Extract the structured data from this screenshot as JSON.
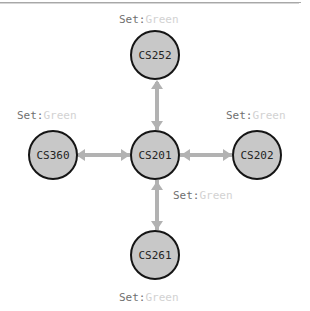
{
  "graph": {
    "type": "node-link-diagram",
    "layout": "cross",
    "nodes": [
      {
        "id": "center",
        "label": "CS201",
        "position": "center"
      },
      {
        "id": "top",
        "label": "CS252",
        "position": "top"
      },
      {
        "id": "left",
        "label": "CS360",
        "position": "left"
      },
      {
        "id": "right",
        "label": "CS202",
        "position": "right"
      },
      {
        "id": "bottom",
        "label": "CS261",
        "position": "bottom"
      }
    ],
    "edges": [
      {
        "from": "CS201",
        "to": "CS252",
        "direction": "bidirectional",
        "annotation_key": "Set:",
        "annotation_value": "Green"
      },
      {
        "from": "CS201",
        "to": "CS360",
        "direction": "bidirectional",
        "annotation_key": "Set:",
        "annotation_value": "Green"
      },
      {
        "from": "CS201",
        "to": "CS202",
        "direction": "bidirectional",
        "annotation_key": "Set:",
        "annotation_value": "Green"
      },
      {
        "from": "CS201",
        "to": "CS261",
        "direction": "bidirectional",
        "annotation_key": "Set:",
        "annotation_value": "Green"
      }
    ],
    "annotations": [
      {
        "id": "top",
        "key": "Set:",
        "value": "Green"
      },
      {
        "id": "left",
        "key": "Set:",
        "value": "Green"
      },
      {
        "id": "right",
        "key": "Set:",
        "value": "Green"
      },
      {
        "id": "mid",
        "key": "Set:",
        "value": "Green"
      },
      {
        "id": "bottom",
        "key": "Set:",
        "value": "Green"
      }
    ],
    "colors": {
      "node_fill": "#c8c8c8",
      "node_border": "#151515",
      "node_text": "#242424",
      "edge": "#b2b2b2",
      "annotation_key": "#6f6f6f",
      "annotation_value": "#d2d2d2",
      "background": "#ffffff",
      "top_rule": "#a8a8a8"
    }
  }
}
